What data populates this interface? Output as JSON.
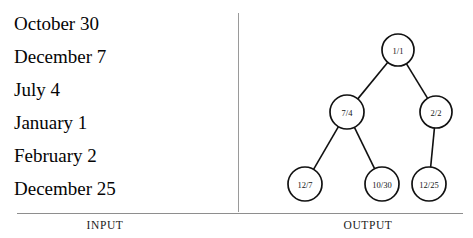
{
  "input": {
    "caption": "INPUT",
    "entries": [
      "October 30",
      "December 7",
      "July 4",
      "January 1",
      "February 2",
      "December 25"
    ]
  },
  "output": {
    "caption": "OUTPUT",
    "tree": {
      "nodes": [
        {
          "id": "root",
          "label": "1/1",
          "cx": 159,
          "cy": 50,
          "r": 16
        },
        {
          "id": "left",
          "label": "7/4",
          "cx": 108,
          "cy": 112,
          "r": 17
        },
        {
          "id": "right",
          "label": "2/2",
          "cx": 197,
          "cy": 112,
          "r": 16
        },
        {
          "id": "leaf-1",
          "label": "12/7",
          "cx": 66,
          "cy": 184,
          "r": 17
        },
        {
          "id": "leaf-2",
          "label": "10/30",
          "cx": 143,
          "cy": 184,
          "r": 17
        },
        {
          "id": "leaf-3",
          "label": "12/25",
          "cx": 190,
          "cy": 184,
          "r": 17
        }
      ],
      "edges": [
        {
          "from": "root",
          "to": "left"
        },
        {
          "from": "root",
          "to": "right"
        },
        {
          "from": "left",
          "to": "leaf-1"
        },
        {
          "from": "left",
          "to": "leaf-2"
        },
        {
          "from": "right",
          "to": "leaf-3"
        }
      ]
    }
  },
  "colors": {
    "stroke": "#111111",
    "divider": "#9a9a9a",
    "rule": "#8e8e8e",
    "background": "#ffffff"
  }
}
